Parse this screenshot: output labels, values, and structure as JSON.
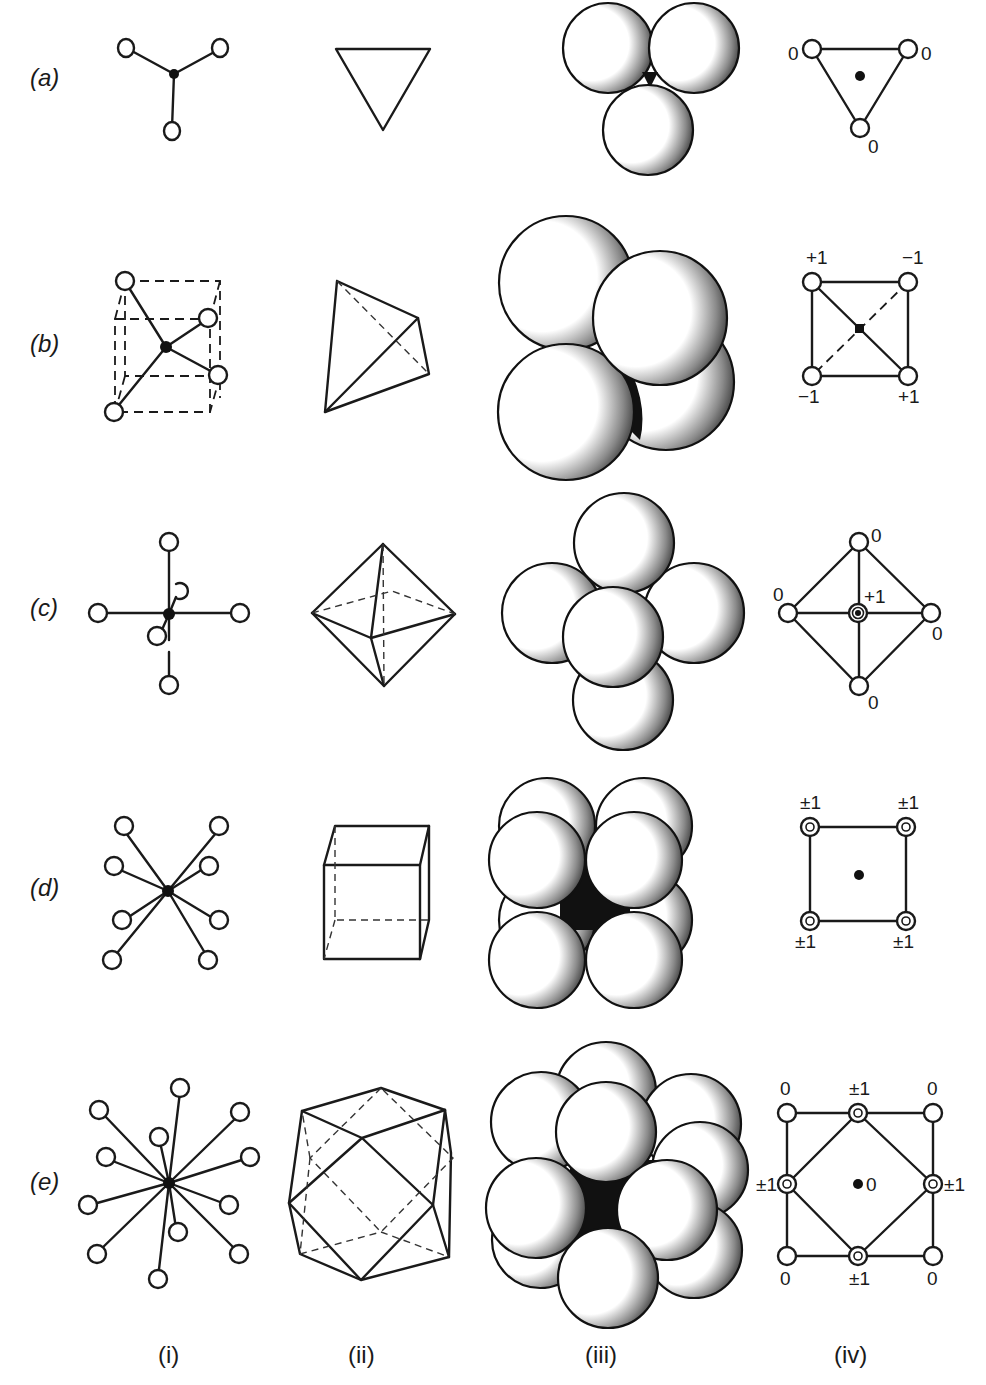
{
  "figure": {
    "rows": [
      {
        "label": "(a)",
        "coordination": 3,
        "polyhedron": "triangle",
        "projection_labels": {
          "top_left": "0",
          "top_right": "0",
          "bottom": "0"
        }
      },
      {
        "label": "(b)",
        "coordination": 4,
        "polyhedron": "tetrahedron",
        "projection_labels": {
          "top_left": "+1",
          "top_right": "−1",
          "bottom_left": "−1",
          "bottom_right": "+1"
        }
      },
      {
        "label": "(c)",
        "coordination": 6,
        "polyhedron": "octahedron",
        "projection_labels": {
          "top": "0",
          "left": "0",
          "right": "0",
          "bottom": "0",
          "center": "+1"
        }
      },
      {
        "label": "(d)",
        "coordination": 8,
        "polyhedron": "cube",
        "projection_labels": {
          "top_left": "±1",
          "top_right": "±1",
          "bottom_left": "±1",
          "bottom_right": "±1"
        }
      },
      {
        "label": "(e)",
        "coordination": 12,
        "polyhedron": "cuboctahedron",
        "projection_labels": {
          "corner_tl": "0",
          "corner_tr": "0",
          "corner_bl": "0",
          "corner_br": "0",
          "mid_top": "±1",
          "mid_left": "±1",
          "mid_right": "±1",
          "mid_bottom": "±1",
          "center": "0"
        }
      }
    ],
    "columns": [
      {
        "label": "(i)"
      },
      {
        "label": "(ii)"
      },
      {
        "label": "(iii)"
      },
      {
        "label": "(iv)"
      }
    ],
    "colors": {
      "ink": "#1a1a1a",
      "paper": "#ffffff"
    }
  }
}
